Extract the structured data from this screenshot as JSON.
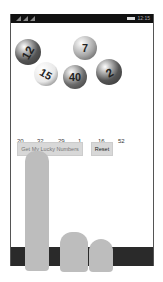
{
  "status_bar": {
    "time": "12:15"
  },
  "balls": [
    {
      "label": "12",
      "color": "#555555",
      "x": 4,
      "y": 25,
      "size": 26,
      "rot": -60
    },
    {
      "label": "7",
      "color": "#a8a8a8",
      "x": 62,
      "y": 22,
      "size": 24,
      "rot": 0
    },
    {
      "label": "15",
      "color": "#e8e8e8",
      "x": 23,
      "y": 48,
      "size": 24,
      "rot": 30
    },
    {
      "label": "40",
      "color": "#6a6a6a",
      "x": 52,
      "y": 51,
      "size": 24,
      "rot": 0
    },
    {
      "label": "2",
      "color": "#555555",
      "x": 85,
      "y": 45,
      "size": 26,
      "rot": -30
    }
  ],
  "lucky_numbers": [
    "20",
    "32",
    "29",
    "1",
    "16",
    "52"
  ],
  "buttons": {
    "get_numbers": "Get My Lucky Numbers",
    "reset": "Reset"
  }
}
